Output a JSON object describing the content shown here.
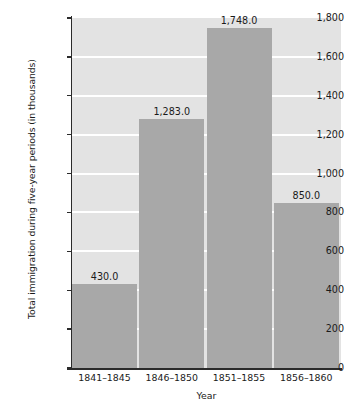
{
  "chart_data": {
    "type": "bar",
    "title": "",
    "xlabel": "Year",
    "ylabel": "Total immigration during five-year periods (in thousands)",
    "categories": [
      "1841–1845",
      "1846–1850",
      "1851–1855",
      "1856–1860"
    ],
    "values": [
      430.0,
      1283.0,
      1748.0,
      850.0
    ],
    "value_labels": [
      "430.0",
      "1,283.0",
      "1,748.0",
      "850.0"
    ],
    "ylim": [
      0,
      1800
    ],
    "ytick_values": [
      0,
      200,
      400,
      600,
      800,
      1000,
      1200,
      1400,
      1600,
      1800
    ],
    "ytick_labels": [
      "0",
      "200",
      "400",
      "600",
      "800",
      "1,000",
      "1,200",
      "1,400",
      "1,600",
      "1,800"
    ],
    "grid": true,
    "gridline_values": [
      200,
      400,
      600,
      800,
      1000,
      1200,
      1400,
      1600
    ],
    "legend": null,
    "legend_position": "none",
    "colors": {
      "bar_fill": "#a8a8a8",
      "plot_background": "#e3e3e3",
      "gridline": "#ffffff",
      "axis_line": "#2b2b2b",
      "text": "#1a1a1a",
      "page_background": "#ffffff"
    }
  }
}
